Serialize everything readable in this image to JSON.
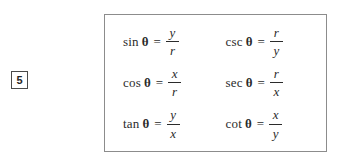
{
  "equation_marker": {
    "number": "5"
  },
  "panel": {
    "border_color": "#8c8c8c",
    "background": "#ffffff",
    "text_color": "#2b2b2b",
    "variable": "θ",
    "equals": "=",
    "rows": [
      {
        "left": {
          "function": "sin",
          "theta": "θ",
          "equals": "=",
          "numerator": "y",
          "denominator": "r"
        },
        "right": {
          "function": "csc",
          "theta": "θ",
          "equals": "=",
          "numerator": "r",
          "denominator": "y"
        }
      },
      {
        "left": {
          "function": "cos",
          "theta": "θ",
          "equals": "=",
          "numerator": "x",
          "denominator": "r"
        },
        "right": {
          "function": "sec",
          "theta": "θ",
          "equals": "=",
          "numerator": "r",
          "denominator": "x"
        }
      },
      {
        "left": {
          "function": "tan",
          "theta": "θ",
          "equals": "=",
          "numerator": "y",
          "denominator": "x"
        },
        "right": {
          "function": "cot",
          "theta": "θ",
          "equals": "=",
          "numerator": "x",
          "denominator": "y"
        }
      }
    ]
  }
}
